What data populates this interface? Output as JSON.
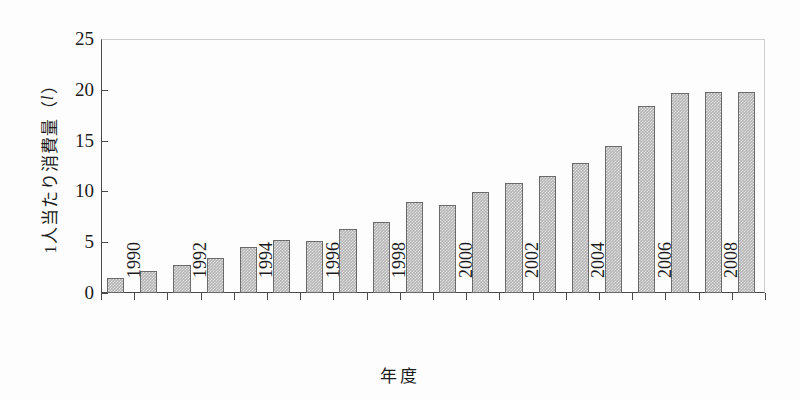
{
  "chart_data": {
    "type": "bar",
    "title": "",
    "subtitle": "",
    "xlabel": "年度",
    "ylabel_prefix": "1人当たり消費量（",
    "ylabel_unit": "l",
    "ylabel_suffix": "）",
    "ylabel_full": "1人当たり消費量（l）",
    "categories": [
      "1990",
      "1991",
      "1992",
      "1993",
      "1994",
      "1995",
      "1996",
      "1997",
      "1998",
      "1999",
      "2000",
      "2001",
      "2002",
      "2003",
      "2004",
      "2005",
      "2006",
      "2007",
      "2008",
      "2009"
    ],
    "values": [
      1.5,
      2.2,
      2.8,
      3.4,
      4.5,
      5.2,
      5.1,
      6.3,
      7.0,
      9.0,
      8.7,
      9.9,
      10.8,
      11.5,
      12.8,
      14.5,
      18.4,
      19.7,
      19.8,
      19.8
    ],
    "ylim": [
      0,
      25
    ],
    "yticks": [
      "0",
      "5",
      "10",
      "15",
      "20",
      "25"
    ],
    "ytick_values": [
      0,
      5,
      10,
      15,
      20,
      25
    ],
    "xtick_labels": [
      "1990",
      "1992",
      "1994",
      "1996",
      "1998",
      "2000",
      "2002",
      "2004",
      "2006",
      "2008"
    ],
    "xtick_label_indices": [
      0,
      2,
      4,
      6,
      8,
      10,
      12,
      14,
      16,
      18
    ],
    "grid": false,
    "legend": null,
    "legend_position": "none",
    "bar_fill_color": "#b4b4b4",
    "bar_edge_color": "#6a6a6a",
    "axis_color": "#4a4a4a",
    "frame_color": "#cfcfcf",
    "background_color": "#fdfdfd",
    "text_color": "#1c1c1c"
  }
}
